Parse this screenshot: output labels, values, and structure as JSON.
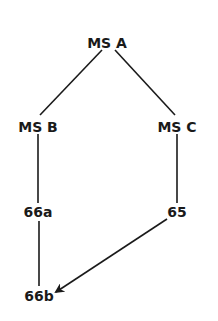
{
  "diagram": {
    "type": "stemma",
    "nodes": [
      {
        "id": "A",
        "label": "MS  A",
        "x": 107,
        "y": 43
      },
      {
        "id": "B",
        "label": "MS  B",
        "x": 38,
        "y": 127
      },
      {
        "id": "C",
        "label": "MS  C",
        "x": 177,
        "y": 127
      },
      {
        "id": "66a",
        "label": "66a",
        "x": 38,
        "y": 212
      },
      {
        "id": "65",
        "label": "65",
        "x": 177,
        "y": 212
      },
      {
        "id": "66b",
        "label": "66b",
        "x": 39,
        "y": 296
      }
    ],
    "edges": [
      {
        "from": "A",
        "to": "B",
        "arrow": false
      },
      {
        "from": "A",
        "to": "C",
        "arrow": false
      },
      {
        "from": "B",
        "to": "66a",
        "arrow": false
      },
      {
        "from": "C",
        "to": "65",
        "arrow": false
      },
      {
        "from": "66a",
        "to": "66b",
        "arrow": false
      },
      {
        "from": "65",
        "to": "66b",
        "arrow": true
      }
    ],
    "line_color": "#1a1a1a"
  }
}
